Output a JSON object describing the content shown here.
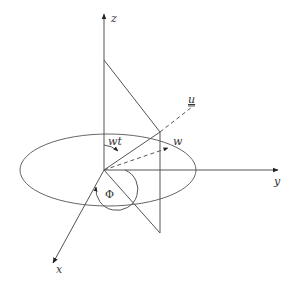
{
  "diagram": {
    "type": "3d-coordinate-system",
    "stroke_color": "#555555",
    "axes": {
      "z": {
        "label": "z"
      },
      "y": {
        "label": "y"
      },
      "x": {
        "label": "x"
      }
    },
    "vectors": {
      "u": {
        "label": "u",
        "style": "dashed",
        "underlined": true
      },
      "w": {
        "label": "w",
        "style": "dashed"
      }
    },
    "angles": {
      "wt": {
        "label": "wt"
      },
      "phi": {
        "label": "Φ"
      }
    },
    "shapes": {
      "ellipse": {
        "description": "horizontal circle in xy-plane"
      },
      "plane": {
        "description": "vertical triangular plane through z-axis and u"
      }
    }
  }
}
